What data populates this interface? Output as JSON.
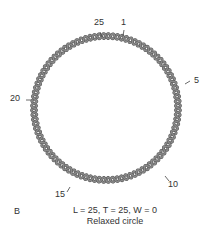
{
  "figure": {
    "panel_label": "B",
    "equation": "L = 25, T = 25, W = 0",
    "caption": "Relaxed circle",
    "markers": [
      {
        "label": "25",
        "position": 25
      },
      {
        "label": "1",
        "position": 1
      },
      {
        "label": "5",
        "position": 5
      },
      {
        "label": "10",
        "position": 10
      },
      {
        "label": "15",
        "position": 15
      },
      {
        "label": "20",
        "position": 20
      }
    ],
    "helix_turns": 25,
    "colors": {
      "strand": "#8a8a8a",
      "strand_edge": "#5a5a5a",
      "text": "#333333"
    }
  }
}
